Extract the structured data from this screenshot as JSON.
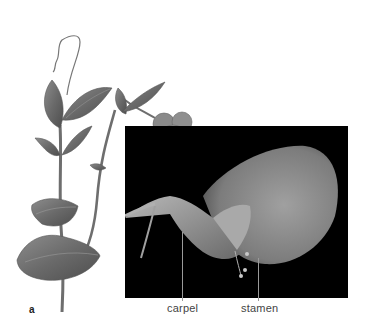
{
  "figure": {
    "panel_letter": "a",
    "labels": {
      "carpel": "carpel",
      "stamen": "stamen"
    },
    "subjects": {
      "illustration": "pea-plant-illustration",
      "photo": "pea-flower-dissection-photo"
    },
    "colors": {
      "background": "#ffffff",
      "photo_background": "#000000",
      "leaf": "#6f6f6f",
      "petal": "#8a8a8a",
      "label_text": "#444444",
      "callout_line": "#9a9a9a"
    }
  }
}
